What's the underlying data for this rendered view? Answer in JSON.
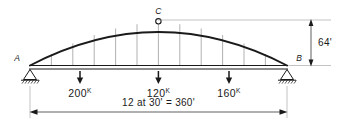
{
  "figure": {
    "type": "three-hinged-arch-structural-diagram",
    "background_color": "#ffffff",
    "line_color": "#1a1a1a",
    "thin_line_color": "#8a8a8a"
  },
  "nodes": {
    "left_support_label": "A",
    "right_support_label": "B",
    "crown_hinge_label": "C"
  },
  "loads": [
    {
      "value": "200",
      "unit": "K",
      "direction": "down"
    },
    {
      "value": "120",
      "unit": "K",
      "direction": "down"
    },
    {
      "value": "160",
      "unit": "K",
      "direction": "down"
    }
  ],
  "dimensions": {
    "rise_label": "64'",
    "span_label": "12 at 30' = 360'"
  },
  "supports": {
    "left_type": "pinned",
    "right_type": "pinned"
  },
  "geometry": {
    "panel_count": 12,
    "hanger_count": 11
  }
}
